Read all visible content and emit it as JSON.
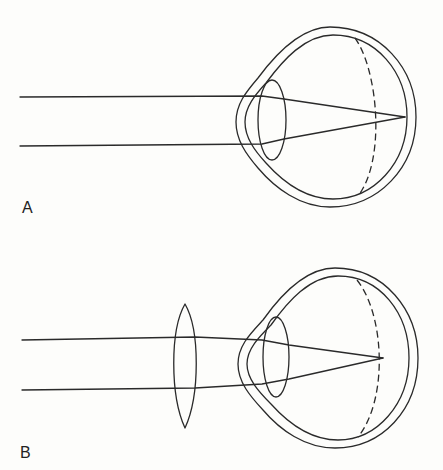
{
  "figure": {
    "panels": [
      {
        "label": "A",
        "description": "Eye with parallel rays focused at the retina by the eye's own lens"
      },
      {
        "label": "B",
        "description": "Eye with a convex corrective lens in front; rays converge onto the retina"
      }
    ]
  },
  "colors": {
    "line": "#2a2a2a",
    "background": "#fdfdfb"
  }
}
